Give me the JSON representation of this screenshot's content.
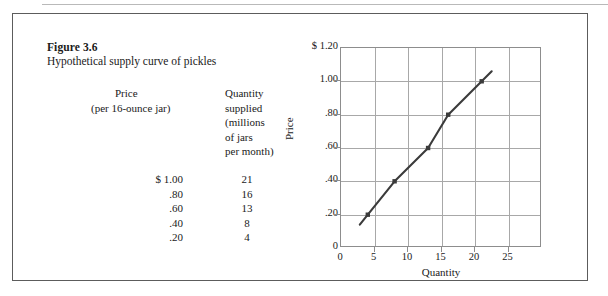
{
  "figure": {
    "number": "Figure 3.6",
    "title": "Hypothetical supply curve of pickles"
  },
  "table": {
    "header": {
      "price_line1": "Price",
      "price_line2": "(per 16-ounce jar)",
      "quantity_lines": [
        "Quantity",
        "supplied",
        "(millions",
        "of jars",
        "per month)"
      ]
    },
    "rows": [
      {
        "price": "$ 1.00",
        "quantity": "21"
      },
      {
        "price": ".80",
        "quantity": "16"
      },
      {
        "price": ".60",
        "quantity": "13"
      },
      {
        "price": ".40",
        "quantity": "8"
      },
      {
        "price": ".20",
        "quantity": "4"
      }
    ]
  },
  "chart_data": {
    "type": "line",
    "title": "",
    "xlabel": "Quantity",
    "ylabel": "Price",
    "x": [
      4,
      8,
      13,
      16,
      21
    ],
    "values": [
      0.2,
      0.4,
      0.6,
      0.8,
      1.0
    ],
    "series": [
      {
        "name": "Supply",
        "x": [
          4,
          8,
          13,
          16,
          21
        ],
        "values": [
          0.2,
          0.4,
          0.6,
          0.8,
          1.0
        ]
      }
    ],
    "xlim": [
      0,
      30
    ],
    "ylim": [
      0,
      1.2
    ],
    "xticks": [
      "0",
      "5",
      "10",
      "15",
      "20",
      "25"
    ],
    "xtick_values": [
      0,
      5,
      10,
      15,
      20,
      25
    ],
    "yticks": [
      "0",
      ".20",
      ".40",
      ".60",
      ".80",
      "1.00",
      "$  1.20"
    ],
    "ytick_values": [
      0,
      0.2,
      0.4,
      0.6,
      0.8,
      1.0,
      1.2
    ],
    "grid": true,
    "legend": "none",
    "line_color": "#3b3b3b",
    "grid_color": "#a8a8a8",
    "marker": "square",
    "line_extends_beyond_points": true
  },
  "colors": {
    "border": "#5c5c5c",
    "grid": "#a8a8a8",
    "curve": "#3b3b3b",
    "text": "#1a1a1a"
  }
}
